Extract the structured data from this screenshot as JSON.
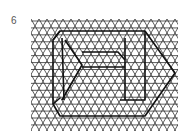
{
  "figure": {
    "number_label": "6",
    "grid": {
      "x0": 31,
      "y0": 19,
      "x1": 178,
      "y1": 131,
      "spacing": 8,
      "row_height": 6.93,
      "line_color": "#333333"
    },
    "shape": {
      "stroke_color": "#111111",
      "paths": [
        "M60,31 L145,31 L175,73 L145,116 L60,116 L53,104 L53,40 Z",
        "M60,31 L53,40",
        "M62,38 L64,100",
        "M65,40 L82,65 L62,100",
        "M82,52 L118,52 L125,60",
        "M82,67 L125,67",
        "M125,38 L125,100",
        "M145,31 L145,100 L120,100",
        "M53,104 L60,98"
      ]
    }
  }
}
